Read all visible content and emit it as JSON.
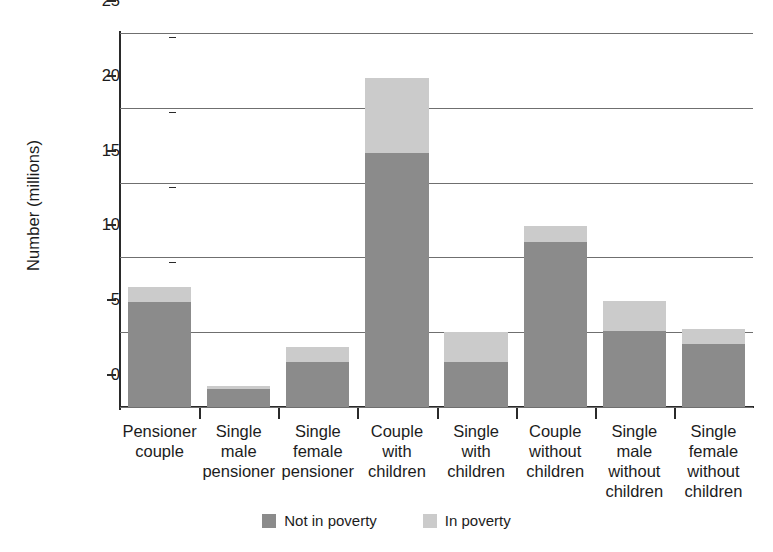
{
  "chart_data": {
    "type": "bar",
    "title": "",
    "subtitle": "",
    "xlabel": "",
    "ylabel": "Number (millions)",
    "ylim": [
      0,
      25
    ],
    "ytick_values": [
      0,
      5,
      10,
      15,
      20,
      25
    ],
    "ytick_labels": [
      "0",
      "5",
      "10",
      "15",
      "20",
      "25"
    ],
    "grid": true,
    "stacked": true,
    "legend_position": "bottom-center",
    "categories": [
      "Pensioner couple",
      "Single male pensioner",
      "Single female pensioner",
      "Couple with children",
      "Single with children",
      "Couple without children",
      "Single male without children",
      "Single female without children"
    ],
    "category_lines": [
      [
        "Pensioner",
        "couple"
      ],
      [
        "Single",
        "male",
        "pensioner"
      ],
      [
        "Single",
        "female",
        "pensioner"
      ],
      [
        "Couple",
        "with",
        "children"
      ],
      [
        "Single",
        "with",
        "children"
      ],
      [
        "Couple",
        "without",
        "children"
      ],
      [
        "Single",
        "male",
        "without",
        "children"
      ],
      [
        "Single",
        "female",
        "without",
        "children"
      ]
    ],
    "series": [
      {
        "name": "Not in poverty",
        "color": "#8b8b8b",
        "values": [
          7.0,
          1.2,
          3.0,
          17.0,
          3.0,
          11.0,
          5.1,
          4.2
        ]
      },
      {
        "name": "In poverty",
        "color": "#cbcbcb",
        "values": [
          1.0,
          0.2,
          1.0,
          5.0,
          2.0,
          1.1,
          2.0,
          1.0
        ]
      }
    ],
    "totals": [
      8.0,
      1.4,
      4.0,
      22.0,
      5.0,
      12.1,
      7.1,
      5.2
    ]
  },
  "legend": {
    "items": [
      {
        "label": "Not in poverty",
        "color": "#8b8b8b"
      },
      {
        "label": "In poverty",
        "color": "#cbcbcb"
      }
    ]
  },
  "colors": {
    "not_in_poverty": "#8b8b8b",
    "in_poverty": "#cbcbcb",
    "axis": "#2a2a2a",
    "gridline": "#6f6f6f",
    "background": "#ffffff",
    "text": "#1c1c1c"
  }
}
